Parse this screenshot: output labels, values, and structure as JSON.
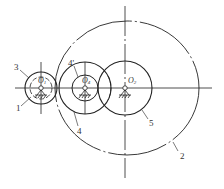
{
  "diagram": {
    "type": "gear train schematic",
    "centers": [
      {
        "id": "O1",
        "label": "O",
        "sub": "1",
        "x": 41,
        "y": 88
      },
      {
        "id": "O4",
        "label": "O",
        "sub": "4",
        "x": 85,
        "y": 88
      },
      {
        "id": "O2",
        "label": "O",
        "sub": "2",
        "x": 125,
        "y": 88
      }
    ],
    "part_labels": [
      {
        "text": "3",
        "x": 14,
        "y": 67
      },
      {
        "text": "1",
        "x": 17,
        "y": 111
      },
      {
        "text": "4'",
        "x": 68,
        "y": 64
      },
      {
        "text": "4",
        "x": 76,
        "y": 134
      },
      {
        "text": "5",
        "x": 150,
        "y": 125
      },
      {
        "text": "2",
        "x": 181,
        "y": 158
      }
    ]
  }
}
